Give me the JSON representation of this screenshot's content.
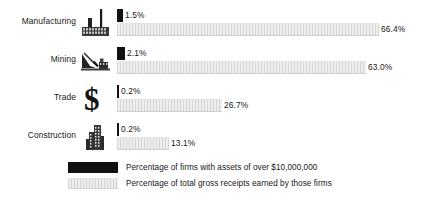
{
  "chart_data": {
    "type": "bar",
    "title": "",
    "subtitle": "",
    "xlabel": "",
    "ylabel": "",
    "orientation": "horizontal",
    "grid": false,
    "legend_position": "bottom",
    "xlim": [
      0,
      100
    ],
    "unit": "%",
    "categories": [
      "Manufacturing",
      "Mining",
      "Trade",
      "Construction"
    ],
    "series": [
      {
        "name": "Percentage of firms with assets of over $10,000,000",
        "color": "#111111",
        "values": [
          1.5,
          2.1,
          0.2,
          0.2
        ],
        "labels": [
          "1.5%",
          "2.1%",
          "0.2%",
          "0.2%"
        ]
      },
      {
        "name": "Percentage of total gross receipts earned by those firms",
        "color": "#dcdcdc",
        "values": [
          66.4,
          63.0,
          26.7,
          13.1
        ],
        "labels": [
          "66.4%",
          "63.0%",
          "26.7%",
          "13.1%"
        ]
      }
    ]
  },
  "rows": [
    {
      "label": "Manufacturing",
      "icon": "factory-icon",
      "dark_value": "1.5%",
      "light_value": "66.4%",
      "dark_width_px": 6,
      "light_width_px": 262
    },
    {
      "label": "Mining",
      "icon": "mining-icon",
      "dark_value": "2.1%",
      "light_value": "63.0%",
      "dark_width_px": 8,
      "light_width_px": 249
    },
    {
      "label": "Trade",
      "icon": "dollar-sign-icon",
      "dark_value": "0.2%",
      "light_value": "26.7%",
      "dark_width_px": 2,
      "light_width_px": 105
    },
    {
      "label": "Construction",
      "icon": "building-icon",
      "dark_value": "0.2%",
      "light_value": "13.1%",
      "dark_width_px": 2,
      "light_width_px": 52
    }
  ],
  "legend": {
    "items": [
      {
        "swatch": "dark",
        "text": "Percentage of firms with assets of over $10,000,000"
      },
      {
        "swatch": "light",
        "text": "Percentage of total gross receipts earned by those firms"
      }
    ]
  },
  "bottom_cut_text": ""
}
